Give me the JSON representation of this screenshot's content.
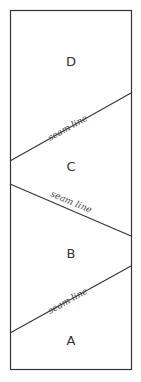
{
  "diagram": {
    "stroke_color": "#333333",
    "background": "#ffffff",
    "sections": [
      {
        "id": "D",
        "label": "D"
      },
      {
        "id": "C",
        "label": "C"
      },
      {
        "id": "B",
        "label": "B"
      },
      {
        "id": "A",
        "label": "A"
      }
    ],
    "seams": [
      {
        "label": "seam line"
      },
      {
        "label": "seam line"
      },
      {
        "label": "seam line"
      }
    ]
  }
}
